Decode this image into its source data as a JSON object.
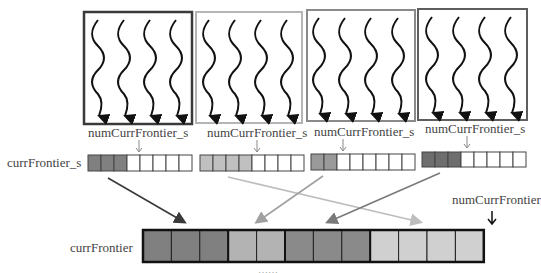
{
  "diagram": {
    "type": "frontier-merge",
    "colors": {
      "block1": "#3a3a3a",
      "block2": "#b5b5b5",
      "block3": "#8a8a8a",
      "block4": "#5e5e5e",
      "fill1": "#808080",
      "fill2": "#b8b8b8",
      "fill3": "#8c8c8c",
      "fill4": "#cfcfcf",
      "arrow1": "#3a3a3a",
      "arrow2": "#bdbdbd",
      "arrow3": "#a0a0a0",
      "arrow4": "#7a7a7a"
    },
    "blocks": [
      {
        "label": "numCurrFrontier_s",
        "threads": 4,
        "filled_cells": 3,
        "total_cells": 8,
        "border": "dark"
      },
      {
        "label": "numCurrFrontier_s",
        "threads": 4,
        "filled_cells": 4,
        "total_cells": 8,
        "border": "light"
      },
      {
        "label": "numCurrFrontier_s",
        "threads": 4,
        "filled_cells": 2,
        "total_cells": 8,
        "border": "medium"
      },
      {
        "label": "numCurrFrontier_s",
        "threads": 4,
        "filled_cells": 3,
        "total_cells": 8,
        "border": "medium-dark"
      }
    ],
    "shared_array_label": "currFrontier_s",
    "global_array_label": "currFrontier",
    "global_counter_label": "numCurrFrontier",
    "global_array_segments": [
      {
        "from_block": 1,
        "cells": 3
      },
      {
        "from_block": 3,
        "cells": 2
      },
      {
        "from_block": 4,
        "cells": 3
      },
      {
        "from_block": 2,
        "cells": 4
      }
    ],
    "caption_partial": "……"
  }
}
